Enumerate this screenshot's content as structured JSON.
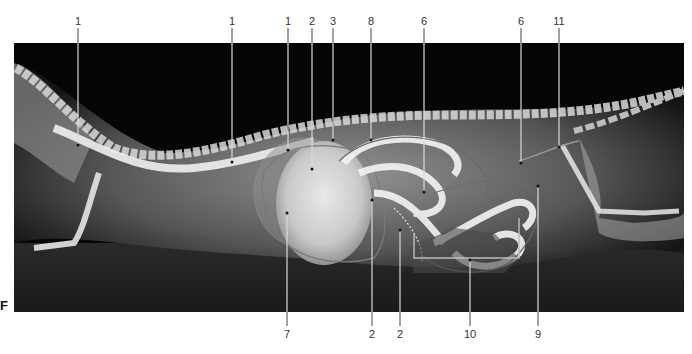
{
  "figure": {
    "panel_letter": "F",
    "image_description": "Lateral radiograph with overlaid anatomical outlines"
  },
  "labels_top": [
    {
      "text": "1",
      "x": 78,
      "end_y": 145
    },
    {
      "text": "1",
      "x": 232,
      "end_y": 162
    },
    {
      "text": "1",
      "x": 288,
      "end_y": 150
    },
    {
      "text": "2",
      "x": 312,
      "end_y": 169
    },
    {
      "text": "3",
      "x": 333,
      "end_y": 140
    },
    {
      "text": "8",
      "x": 371,
      "end_y": 140
    },
    {
      "text": "6",
      "x": 424,
      "end_y": 192
    },
    {
      "text": "6",
      "x": 521,
      "end_y": 163
    },
    {
      "text": "11",
      "x": 559,
      "end_y": 147
    }
  ],
  "labels_bottom": [
    {
      "text": "7",
      "x": 287,
      "end_y": 213
    },
    {
      "text": "2",
      "x": 372,
      "end_y": 200
    },
    {
      "text": "2",
      "x": 400,
      "end_y": 230
    },
    {
      "text": "10",
      "x": 470,
      "end_y": 260
    },
    {
      "text": "9",
      "x": 538,
      "end_y": 186
    }
  ],
  "colors": {
    "background": "#ffffff",
    "xray_bg": "#050505",
    "label_text": "#333333",
    "leader_line": "#d8d8d8"
  }
}
